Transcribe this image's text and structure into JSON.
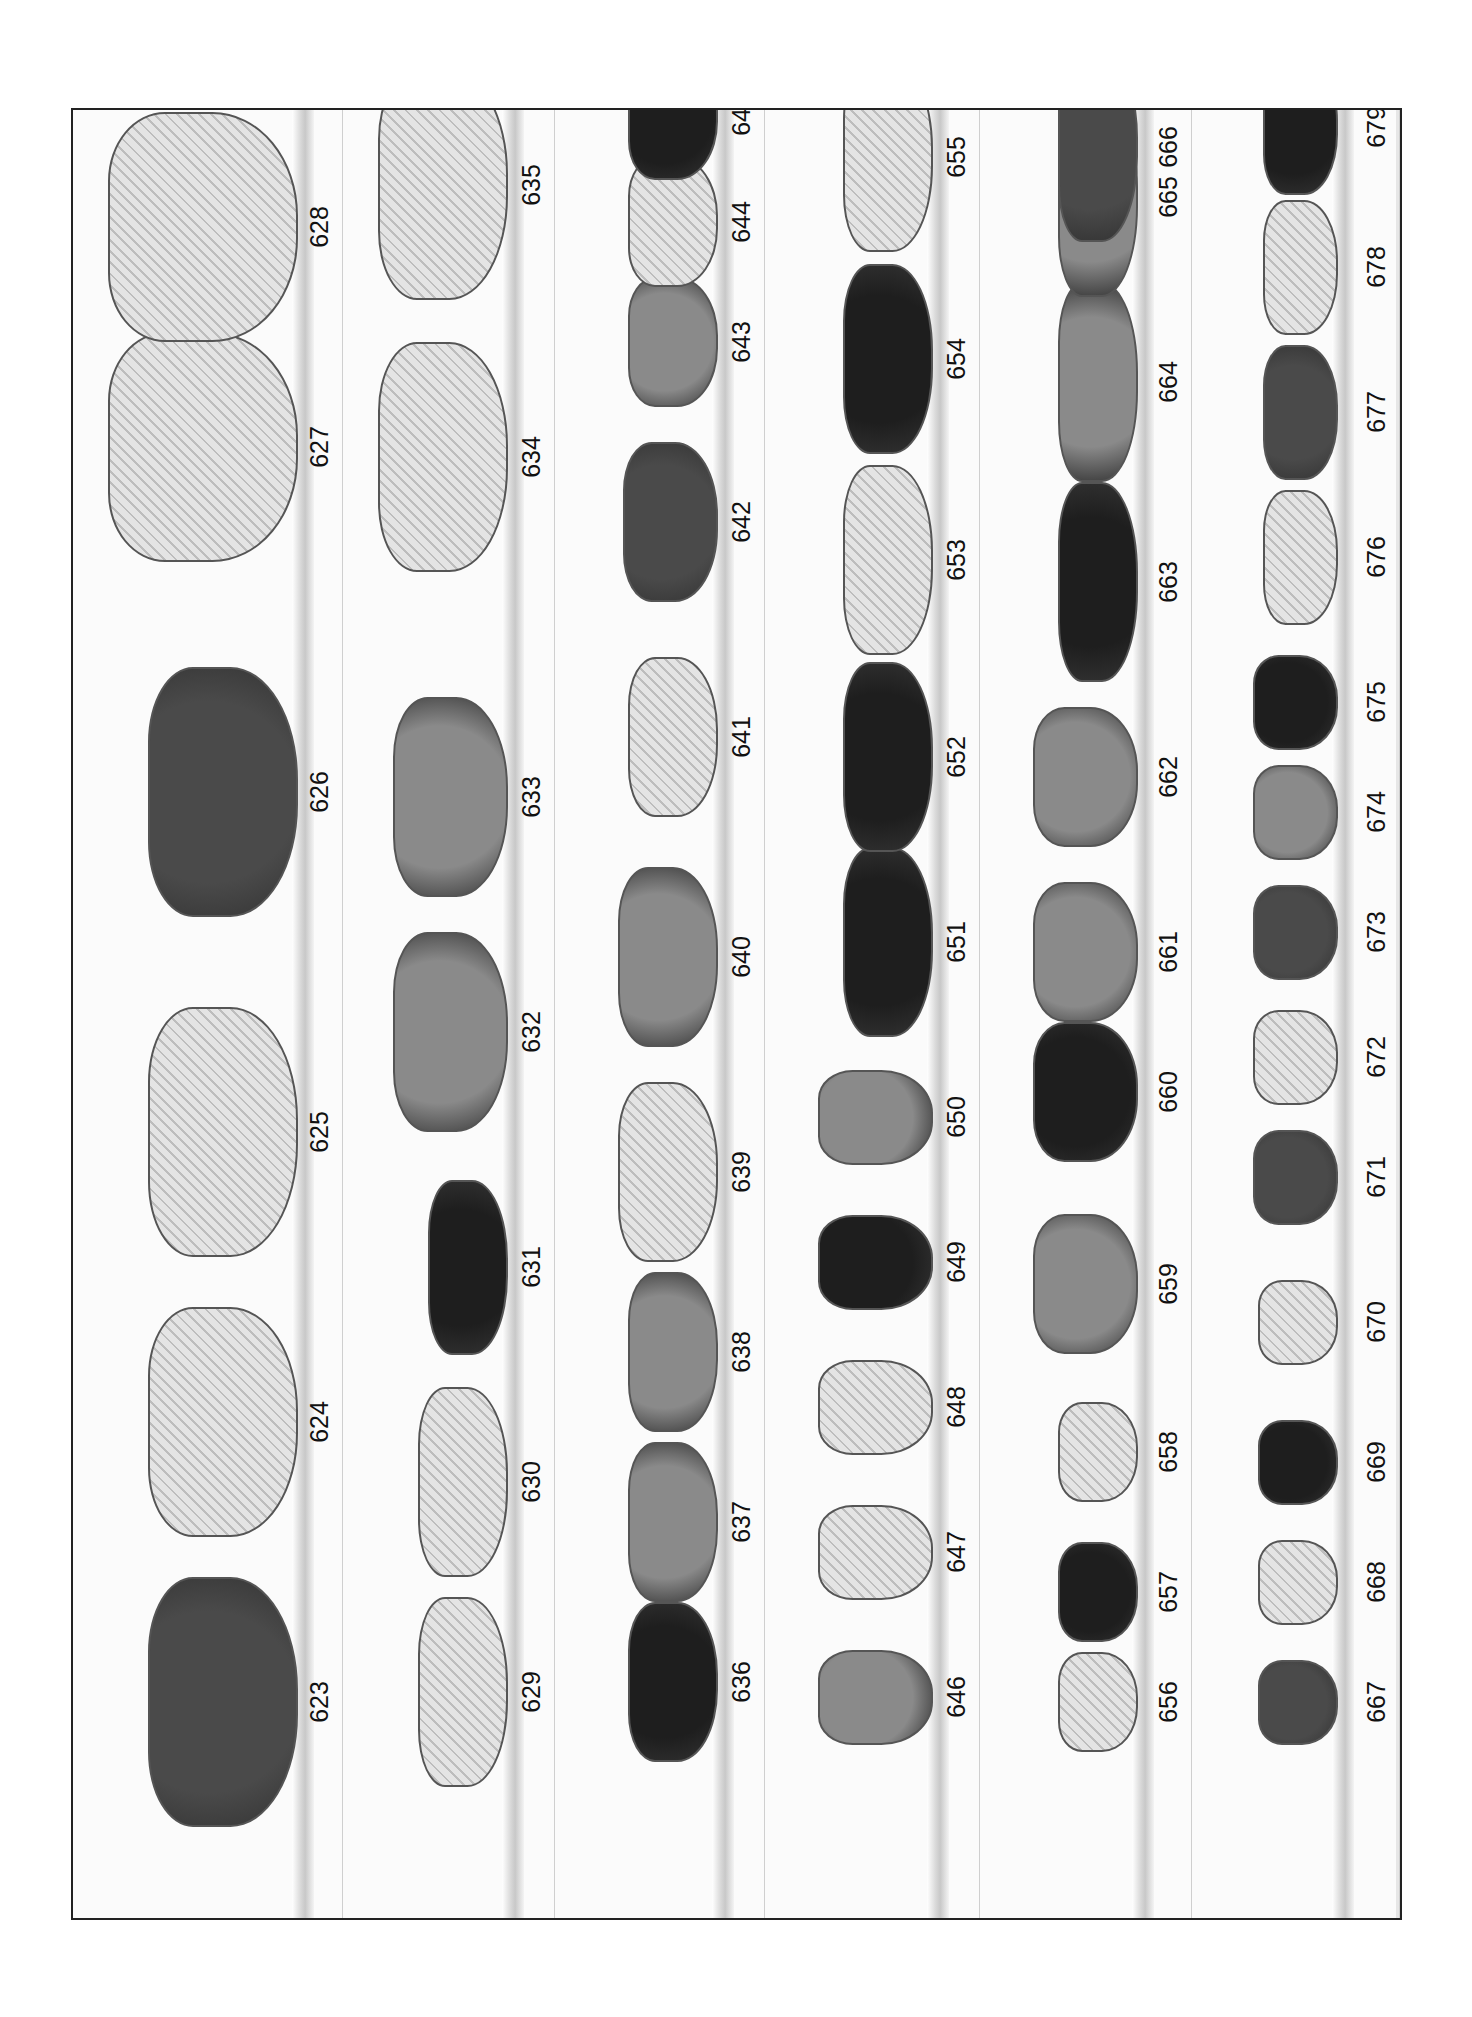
{
  "page": {
    "columns": [
      {
        "shelf_x": 300,
        "label_x": 318,
        "items": [
          {
            "number": "623",
            "y": 1700,
            "shape": "ruffled-bowl",
            "tone": "dark",
            "w": 150,
            "h": 250
          },
          {
            "number": "624",
            "y": 1420,
            "shape": "ruffled-bowl",
            "tone": "light",
            "w": 150,
            "h": 230
          },
          {
            "number": "625",
            "y": 1130,
            "shape": "ruffled-bowl",
            "tone": "light",
            "w": 150,
            "h": 250
          },
          {
            "number": "626",
            "y": 790,
            "shape": "ruffled-bowl",
            "tone": "dark",
            "w": 150,
            "h": 250
          },
          {
            "number": "627",
            "y": 445,
            "shape": "owl",
            "tone": "light",
            "w": 190,
            "h": 230
          },
          {
            "number": "628",
            "y": 225,
            "shape": "owl",
            "tone": "light",
            "w": 190,
            "h": 230
          }
        ]
      },
      {
        "shelf_x": 510,
        "label_x": 530,
        "items": [
          {
            "number": "629",
            "y": 1690,
            "shape": "rect-dish",
            "tone": "light",
            "w": 90,
            "h": 190
          },
          {
            "number": "630",
            "y": 1480,
            "shape": "rect-dish",
            "tone": "light",
            "w": 90,
            "h": 190
          },
          {
            "number": "631",
            "y": 1265,
            "shape": "rect-dish",
            "tone": "black",
            "w": 80,
            "h": 175
          },
          {
            "number": "632",
            "y": 1030,
            "shape": "round-bowl",
            "tone": "mid",
            "w": 115,
            "h": 200
          },
          {
            "number": "633",
            "y": 795,
            "shape": "round-bowl",
            "tone": "mid",
            "w": 115,
            "h": 200
          },
          {
            "number": "634",
            "y": 455,
            "shape": "boot",
            "tone": "light",
            "w": 130,
            "h": 230
          },
          {
            "number": "635",
            "y": 183,
            "shape": "boot",
            "tone": "light",
            "w": 130,
            "h": 230
          }
        ]
      },
      {
        "shelf_x": 720,
        "label_x": 740,
        "items": [
          {
            "number": "636",
            "y": 1680,
            "shape": "carriage",
            "tone": "black",
            "w": 90,
            "h": 160
          },
          {
            "number": "637",
            "y": 1520,
            "shape": "carriage",
            "tone": "mid",
            "w": 90,
            "h": 160
          },
          {
            "number": "638",
            "y": 1350,
            "shape": "carriage",
            "tone": "mid",
            "w": 90,
            "h": 160
          },
          {
            "number": "639",
            "y": 1170,
            "shape": "shell-dish",
            "tone": "light",
            "w": 100,
            "h": 180
          },
          {
            "number": "640",
            "y": 955,
            "shape": "shell-dish",
            "tone": "mid",
            "w": 100,
            "h": 180
          },
          {
            "number": "641",
            "y": 735,
            "shape": "shell-dish",
            "tone": "light",
            "w": 90,
            "h": 160
          },
          {
            "number": "642",
            "y": 520,
            "shape": "shell-dish",
            "tone": "dark",
            "w": 95,
            "h": 160
          },
          {
            "number": "643",
            "y": 340,
            "shape": "top-hat",
            "tone": "mid",
            "w": 90,
            "h": 130
          },
          {
            "number": "644",
            "y": 220,
            "shape": "top-hat",
            "tone": "light",
            "w": 90,
            "h": 130
          },
          {
            "number": "645",
            "y": 113,
            "shape": "top-hat",
            "tone": "black",
            "w": 90,
            "h": 130
          }
        ]
      },
      {
        "shelf_x": 935,
        "label_x": 955,
        "items": [
          {
            "number": "646",
            "y": 1695,
            "shape": "tumbler",
            "tone": "mid",
            "w": 115,
            "h": 95
          },
          {
            "number": "647",
            "y": 1550,
            "shape": "tumbler",
            "tone": "light",
            "w": 115,
            "h": 95
          },
          {
            "number": "648",
            "y": 1405,
            "shape": "tumbler",
            "tone": "light",
            "w": 115,
            "h": 95
          },
          {
            "number": "649",
            "y": 1260,
            "shape": "tumbler",
            "tone": "black",
            "w": 115,
            "h": 95
          },
          {
            "number": "650",
            "y": 1115,
            "shape": "tumbler",
            "tone": "mid",
            "w": 115,
            "h": 95
          },
          {
            "number": "651",
            "y": 940,
            "shape": "slipper",
            "tone": "black",
            "w": 90,
            "h": 190
          },
          {
            "number": "652",
            "y": 755,
            "shape": "slipper",
            "tone": "black",
            "w": 90,
            "h": 190
          },
          {
            "number": "653",
            "y": 558,
            "shape": "slipper",
            "tone": "light",
            "w": 90,
            "h": 190
          },
          {
            "number": "654",
            "y": 357,
            "shape": "slipper",
            "tone": "black",
            "w": 90,
            "h": 190
          },
          {
            "number": "655",
            "y": 155,
            "shape": "slipper",
            "tone": "light",
            "w": 90,
            "h": 190
          }
        ]
      },
      {
        "shelf_x": 1140,
        "label_x": 1167,
        "items": [
          {
            "number": "656",
            "y": 1700,
            "shape": "top-hat",
            "tone": "light",
            "w": 80,
            "h": 100
          },
          {
            "number": "657",
            "y": 1590,
            "shape": "top-hat",
            "tone": "black",
            "w": 80,
            "h": 100
          },
          {
            "number": "658",
            "y": 1450,
            "shape": "top-hat",
            "tone": "light",
            "w": 80,
            "h": 100
          },
          {
            "number": "659",
            "y": 1282,
            "shape": "slipper-heel",
            "tone": "mid",
            "w": 105,
            "h": 140
          },
          {
            "number": "660",
            "y": 1090,
            "shape": "slipper-heel",
            "tone": "black",
            "w": 105,
            "h": 140
          },
          {
            "number": "661",
            "y": 950,
            "shape": "slipper-heel",
            "tone": "mid",
            "w": 105,
            "h": 140
          },
          {
            "number": "662",
            "y": 775,
            "shape": "slipper-heel",
            "tone": "mid",
            "w": 105,
            "h": 140
          },
          {
            "number": "663",
            "y": 580,
            "shape": "fan-dish",
            "tone": "black",
            "w": 80,
            "h": 200
          },
          {
            "number": "664",
            "y": 380,
            "shape": "fan-dish",
            "tone": "mid",
            "w": 80,
            "h": 200
          },
          {
            "number": "665",
            "y": 195,
            "shape": "fan-dish",
            "tone": "mid",
            "w": 80,
            "h": 200
          },
          {
            "number": "666",
            "y": 145,
            "shape": "fan-dish",
            "tone": "dark",
            "w": 80,
            "h": 190
          }
        ]
      },
      {
        "shelf_x": 1340,
        "label_x": 1375,
        "items": [
          {
            "number": "667",
            "y": 1700,
            "shape": "toothpick",
            "tone": "dark",
            "w": 80,
            "h": 85
          },
          {
            "number": "668",
            "y": 1580,
            "shape": "toothpick",
            "tone": "light",
            "w": 80,
            "h": 85
          },
          {
            "number": "669",
            "y": 1460,
            "shape": "toothpick",
            "tone": "black",
            "w": 80,
            "h": 85
          },
          {
            "number": "670",
            "y": 1320,
            "shape": "toothpick",
            "tone": "light",
            "w": 80,
            "h": 85
          },
          {
            "number": "671",
            "y": 1175,
            "shape": "basket",
            "tone": "dark",
            "w": 85,
            "h": 95
          },
          {
            "number": "672",
            "y": 1055,
            "shape": "basket",
            "tone": "light",
            "w": 85,
            "h": 95
          },
          {
            "number": "673",
            "y": 930,
            "shape": "basket",
            "tone": "dark",
            "w": 85,
            "h": 95
          },
          {
            "number": "674",
            "y": 810,
            "shape": "basket",
            "tone": "mid",
            "w": 85,
            "h": 95
          },
          {
            "number": "675",
            "y": 700,
            "shape": "basket",
            "tone": "black",
            "w": 85,
            "h": 95
          },
          {
            "number": "676",
            "y": 555,
            "shape": "slipper",
            "tone": "light",
            "w": 75,
            "h": 135
          },
          {
            "number": "677",
            "y": 410,
            "shape": "slipper",
            "tone": "dark",
            "w": 75,
            "h": 135
          },
          {
            "number": "678",
            "y": 265,
            "shape": "slipper",
            "tone": "light",
            "w": 75,
            "h": 135
          },
          {
            "number": "679",
            "y": 125,
            "shape": "slipper",
            "tone": "black",
            "w": 75,
            "h": 135
          }
        ]
      }
    ],
    "tones": {
      "light": "#cfcfcf",
      "mid": "#8a8a8a",
      "dark": "#4a4a4a",
      "black": "#1e1e1e"
    }
  }
}
